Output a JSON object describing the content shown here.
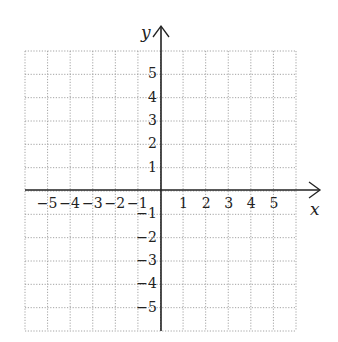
{
  "diagram": {
    "type": "coordinate-plane",
    "x_axis": {
      "label": "x",
      "min": -6,
      "max": 6,
      "tick_labels": [
        "−5",
        "−4",
        "−3",
        "−2",
        "−1",
        "1",
        "2",
        "3",
        "4",
        "5"
      ]
    },
    "y_axis": {
      "label": "y",
      "min": -6,
      "max": 6,
      "tick_labels": [
        "5",
        "4",
        "3",
        "2",
        "1",
        "−1",
        "−2",
        "−3",
        "−4",
        "−5"
      ]
    },
    "grid": {
      "style": "dotted",
      "color": "#9a9a9a",
      "cells_x": 12,
      "cells_y": 12
    },
    "axis_color": "#222222"
  }
}
